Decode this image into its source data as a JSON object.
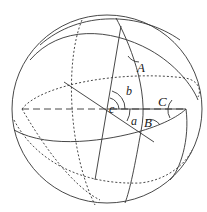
{
  "diagram": {
    "colors": {
      "stroke": "#333333",
      "background": "#ffffff"
    },
    "labels": {
      "angle_A": "A",
      "angle_B": "B",
      "angle_C": "C",
      "arc_a": "a",
      "arc_b": "b",
      "arc_c": "c"
    }
  }
}
